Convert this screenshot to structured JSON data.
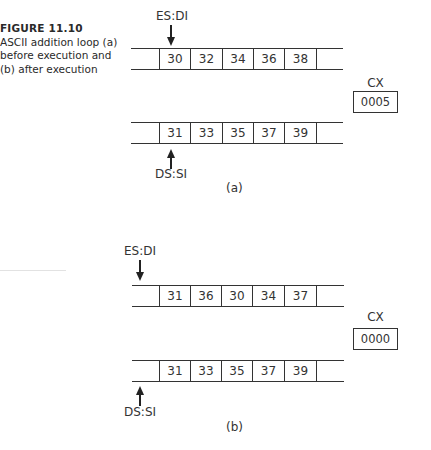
{
  "caption": {
    "figure_number": "FIGURE 11.10",
    "description": "ASCII addition loop (a) before execution and (b) after execution"
  },
  "panel_a": {
    "label": "(a)",
    "destination": {
      "pointer_label": "ES:DI",
      "cells": [
        "30",
        "32",
        "34",
        "36",
        "38"
      ]
    },
    "source": {
      "pointer_label": "DS:SI",
      "cells": [
        "31",
        "33",
        "35",
        "37",
        "39"
      ]
    },
    "register": {
      "name": "CX",
      "value": "0005"
    }
  },
  "panel_b": {
    "label": "(b)",
    "destination": {
      "pointer_label": "ES:DI",
      "cells": [
        "31",
        "36",
        "30",
        "34",
        "37"
      ]
    },
    "source": {
      "pointer_label": "DS:SI",
      "cells": [
        "31",
        "33",
        "35",
        "37",
        "39"
      ]
    },
    "register": {
      "name": "CX",
      "value": "0000"
    }
  }
}
